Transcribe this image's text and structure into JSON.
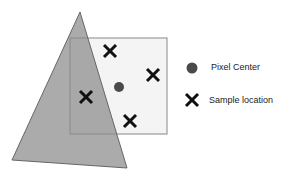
{
  "diagram": {
    "pixel_square": {
      "x": 70,
      "y": 38,
      "w": 97,
      "h": 96,
      "fill": "#f4f4f4",
      "stroke": "#888888"
    },
    "triangle": {
      "points": "80,12 12,160 127,168",
      "fill": "#9a9a9a",
      "opacity": 0.75,
      "stroke": "#666666"
    },
    "pixel_center": {
      "cx": 119,
      "cy": 87,
      "r": 5,
      "color": "#4a4a4a"
    },
    "samples": [
      {
        "x": 110,
        "y": 51
      },
      {
        "x": 153,
        "y": 75
      },
      {
        "x": 86,
        "y": 97
      },
      {
        "x": 130,
        "y": 121
      }
    ]
  },
  "legend": {
    "pixel_center_label": "Pixel Center",
    "sample_location_label": "Sample location"
  }
}
